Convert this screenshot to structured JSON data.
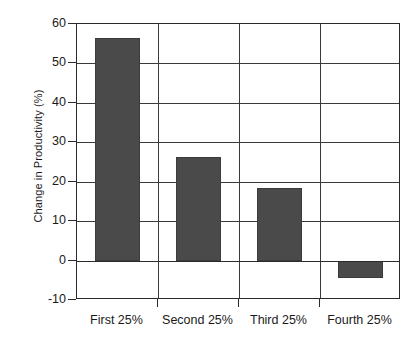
{
  "chart_data": {
    "type": "bar",
    "title": "",
    "xlabel": "",
    "ylabel": "Change in Productivity (%)",
    "categories": [
      "First 25%",
      "Second 25%",
      "Third 25%",
      "Fourth 25%"
    ],
    "values": [
      56.5,
      26.3,
      18.3,
      -4.5
    ],
    "ylim": [
      -10,
      60
    ],
    "ytick_labels": [
      "60",
      "50",
      "40",
      "30",
      "20",
      "10",
      "0",
      "-10"
    ],
    "ytick_values": [
      60,
      50,
      40,
      30,
      20,
      10,
      0,
      -10
    ],
    "grid": "horizontal-and-category-dividers",
    "legend": "none",
    "bar_color": "#4a4a4a",
    "bar_edge_color": "#3b3b3b",
    "axis_color": "#2b2b2b",
    "grid_color": "#3a3a3a",
    "background_color": "#ffffff",
    "text_color": "#1a1a1a"
  }
}
